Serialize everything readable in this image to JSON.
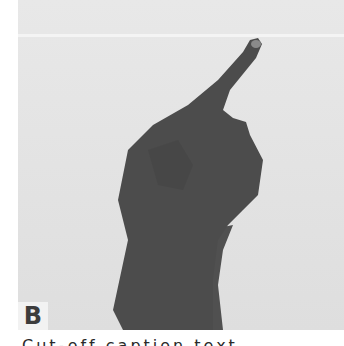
{
  "figure": {
    "panel_label": "B",
    "colors": {
      "background": "#e4e4e4",
      "hand": "#4a4a4a",
      "label_bg": "#f2f2f2",
      "label_text": "#3c3c3c"
    }
  },
  "caption": {
    "text": "Cut-off caption text"
  }
}
